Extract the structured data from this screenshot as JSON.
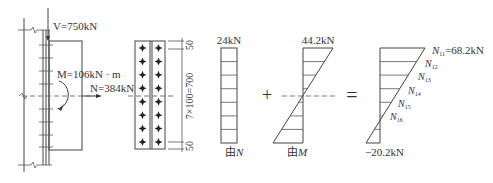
{
  "connection_sketch": {
    "shear_label": "V=750kN",
    "moment_label": "M=106kN · m",
    "axial_label": "N=384kN"
  },
  "bolt_layout": {
    "columns": 2,
    "rows": 8,
    "dim_top": "50",
    "dim_middle": "7×100=700",
    "dim_bottom": "50"
  },
  "diagram_axial": {
    "top_value": "24kN",
    "caption_prefix": "由",
    "caption_var": "N",
    "divisions": 7
  },
  "operator_plus": "+",
  "diagram_moment": {
    "top_value": "44.2kN",
    "caption_prefix": "由",
    "caption_var": "M"
  },
  "operator_equals": "=",
  "diagram_result": {
    "top_label_var": "N",
    "top_label_sub": "11",
    "top_label_value": "=68.2kN",
    "bottom_value": "−20.2kN",
    "bolt_labels": [
      {
        "var": "N",
        "sub": "12"
      },
      {
        "var": "N",
        "sub": "13"
      },
      {
        "var": "N",
        "sub": "14"
      },
      {
        "var": "N",
        "sub": "15"
      },
      {
        "var": "N",
        "sub": "16"
      }
    ]
  }
}
